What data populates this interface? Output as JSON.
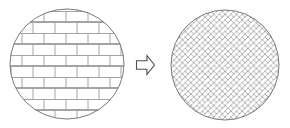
{
  "figure": {
    "title": "Brick bond pattern transformation diagram",
    "background_color": "#ffffff",
    "width": 290,
    "height": 128,
    "line_color": "#8c8c8c",
    "outline_color": "#7a7a7a",
    "arrow_color": "#5a5a5a"
  },
  "left_shape": {
    "name": "Circular region with running bond brick pattern",
    "pattern": "running-bond",
    "shape": "circle",
    "center_x": 67,
    "center_y": 64,
    "radius_x": 57,
    "radius_y": 55,
    "brick_width": 22,
    "brick_height": 11,
    "row_count": 10,
    "stagger": "half-brick offset on alternating rows",
    "outline_color": "#7a7a7a",
    "joint_color": "#9a9a9a",
    "fill_color": "#ffffff"
  },
  "arrow": {
    "name": "Transformation arrow",
    "direction": "right",
    "style": "hollow block arrow",
    "x": 136,
    "y": 55,
    "width": 18,
    "height": 19,
    "stroke_color": "#4f4f4f",
    "fill_color": "#ffffff",
    "label": ""
  },
  "right_shape": {
    "name": "Circular region with herringbone brick pattern",
    "pattern": "herringbone",
    "shape": "circle",
    "center_x": 225,
    "center_y": 65,
    "radius_x": 54,
    "radius_y": 55,
    "brick_length": 11,
    "brick_width": 4,
    "angle_degrees": 45,
    "outline_color": "#7a7a7a",
    "joint_color": "#9a9a9a",
    "fill_color": "#ffffff"
  },
  "labels": {
    "left_caption": "",
    "right_caption": "",
    "arrow_caption": ""
  }
}
